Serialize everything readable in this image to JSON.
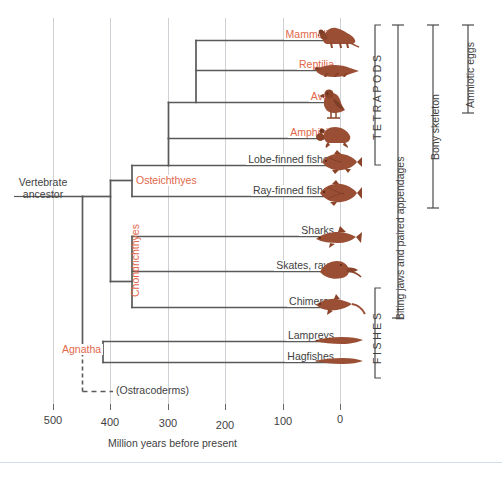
{
  "figure": {
    "type": "cladogram",
    "root_label": "Vertebrate ancestor",
    "root_label_line1": "Vertebrate",
    "root_label_line2": "ancestor",
    "extinct_label": "(Ostracoderms)"
  },
  "axis": {
    "title": "Million years before present",
    "ticks": [
      "500",
      "400",
      "300",
      "200",
      "100",
      "0"
    ],
    "tick_values": [
      500,
      400,
      300,
      200,
      100,
      0
    ],
    "direction": "reversed",
    "unit": "million years"
  },
  "tips": [
    {
      "label": "Mammalia",
      "clade": true,
      "icon": "mouse-silhouette",
      "origin": 200
    },
    {
      "label": "Reptilia",
      "clade": true,
      "icon": "lizard-silhouette",
      "origin": 280
    },
    {
      "label": "Aves",
      "clade": true,
      "icon": "bird-silhouette",
      "origin": 200
    },
    {
      "label": "Amphibia",
      "clade": true,
      "icon": "frog-silhouette",
      "origin": 350
    },
    {
      "label": "Lobe-finned fishes",
      "clade": false,
      "icon": "lobefin-silhouette",
      "origin": 410
    },
    {
      "label": "Ray-finned fishes",
      "clade": false,
      "icon": "rayfin-silhouette",
      "origin": 410
    },
    {
      "label": "Sharks",
      "clade": false,
      "icon": "shark-silhouette",
      "origin": 420
    },
    {
      "label": "Skates, rays",
      "clade": false,
      "icon": "ray-silhouette",
      "origin": 420
    },
    {
      "label": "Chimeras",
      "clade": false,
      "icon": "chimera-silhouette",
      "origin": 420
    },
    {
      "label": "Lampreys",
      "clade": false,
      "icon": "lamprey-silhouette",
      "origin": 460
    },
    {
      "label": "Hagfishes",
      "clade": false,
      "icon": "hagfish-silhouette",
      "origin": 460
    }
  ],
  "clade_labels": [
    {
      "name": "Osteichthyes",
      "orientation": "horizontal",
      "color": "#e2674a"
    },
    {
      "name": "Chondrichthyes",
      "orientation": "vertical",
      "color": "#e2674a"
    },
    {
      "name": "Agnatha",
      "orientation": "horizontal",
      "color": "#e2674a"
    }
  ],
  "brackets": [
    {
      "name": "TETRAPODS",
      "spans": "Mammalia-Amphibia",
      "style": "spaced"
    },
    {
      "name": "FISHES",
      "spans": "Sharks-Hagfishes",
      "style": "spaced"
    },
    {
      "name": "Biting jaws and paired appendages",
      "spans": "Mammalia-Chimeras",
      "style": "normal"
    },
    {
      "name": "Bony skeleton",
      "spans": "Mammalia-Ray-finned fishes",
      "style": "normal"
    },
    {
      "name": "Amniotic eggs",
      "spans": "Mammalia-Aves",
      "style": "normal"
    }
  ],
  "colors": {
    "clade_text": "#e2674a",
    "tip_text": "#3f3f3f",
    "branch": "#5a5a5a",
    "gridline": "#cfcfd6",
    "animal": "#9a4f34",
    "animal_dark": "#7e3d26",
    "bottom_rule": "#cfdded"
  }
}
